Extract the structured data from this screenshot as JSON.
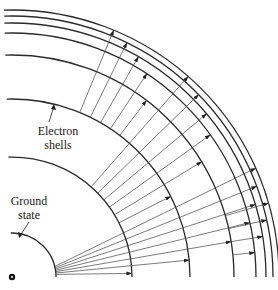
{
  "diagram": {
    "title": "",
    "labels": {
      "electron_shells_line1": "Electron",
      "electron_shells_line2": "shells",
      "ground_state_line1": "Ground",
      "ground_state_line2": "state"
    },
    "nucleus": {
      "cx": 12,
      "cy": 277
    },
    "shells": [
      {
        "name": "ground-state",
        "radius": 44
      },
      {
        "name": "shell-2",
        "radius": 120
      },
      {
        "name": "shell-3",
        "radius": 178
      },
      {
        "name": "shell-4",
        "radius": 222
      },
      {
        "name": "shell-5",
        "radius": 244
      },
      {
        "name": "shell-6",
        "radius": 254
      },
      {
        "name": "shell-7",
        "radius": 261
      },
      {
        "name": "shell-8",
        "radius": 267
      }
    ],
    "transition_groups": [
      {
        "from": 0,
        "to_shells": [
          1,
          2,
          3,
          4,
          5,
          6,
          7
        ],
        "description": "Lyman-like series from ground state"
      },
      {
        "from": 1,
        "to_shells": [
          2,
          3,
          4,
          5,
          6,
          7
        ],
        "description": "Series from shell 2"
      },
      {
        "from": 2,
        "to_shells": [
          3,
          4,
          5,
          6,
          7
        ],
        "description": "Series from shell 3"
      },
      {
        "from": 3,
        "to_shells": [
          4,
          5,
          6,
          7
        ],
        "description": "Series from shell 4"
      }
    ],
    "colors": {
      "line": "#2a2a2a",
      "background": "#ffffff"
    }
  }
}
